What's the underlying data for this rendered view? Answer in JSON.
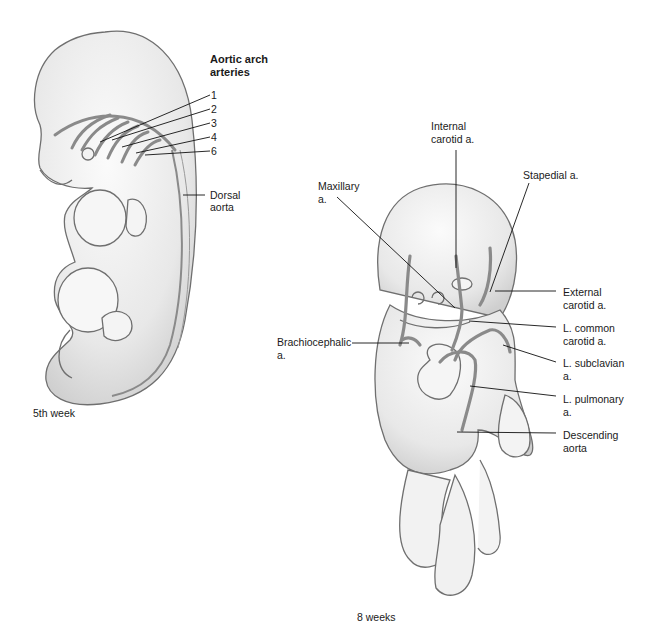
{
  "figure": {
    "left_panel": {
      "caption": "5th week",
      "heading_line1": "Aortic arch",
      "heading_line2": "arteries",
      "arch_numbers": [
        "1",
        "2",
        "3",
        "4",
        "6"
      ],
      "dorsal_aorta_line1": "Dorsal",
      "dorsal_aorta_line2": "aorta"
    },
    "right_panel": {
      "caption": "8 weeks",
      "labels": {
        "internal_carotid_line1": "Internal",
        "internal_carotid_line2": "carotid a.",
        "maxillary_line1": "Maxillary",
        "maxillary_line2": "a.",
        "stapedial": "Stapedial a.",
        "external_carotid_line1": "External",
        "external_carotid_line2": "carotid a.",
        "l_common_carotid_line1": "L. common",
        "l_common_carotid_line2": "carotid a.",
        "brachiocephalic_line1": "Brachiocephalic",
        "brachiocephalic_line2": "a.",
        "l_subclavian_line1": "L. subclavian",
        "l_subclavian_line2": "a.",
        "l_pulmonary_line1": "L. pulmonary",
        "l_pulmonary_line2": "a.",
        "descending_aorta_line1": "Descending",
        "descending_aorta_line2": "aorta"
      }
    },
    "colors": {
      "outline": "#6f6f6f",
      "skin": "#eeeeee",
      "vessel": "#8a8a8a",
      "leader": "#111111"
    }
  }
}
